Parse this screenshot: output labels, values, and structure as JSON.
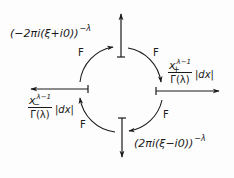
{
  "diagram": {
    "nodes": {
      "top": {
        "base": "(−2πi(ξ+i0))",
        "exponent": "−λ"
      },
      "right": {
        "numerator_base": "x",
        "numerator_sub": "+",
        "numerator_exp": "λ−1",
        "denominator": "Γ(λ)",
        "measure": "|dx|"
      },
      "bottom": {
        "base": "(2πi(ξ−i0))",
        "exponent": "−λ"
      },
      "left": {
        "numerator_base": "x",
        "numerator_sub": "−",
        "numerator_exp": "λ−1",
        "denominator": "Γ(λ)",
        "measure": "|dx|"
      }
    },
    "edges": [
      {
        "from": "left",
        "to": "top",
        "label": "F"
      },
      {
        "from": "top",
        "to": "right",
        "label": "F"
      },
      {
        "from": "right",
        "to": "bottom",
        "label": "F"
      },
      {
        "from": "bottom",
        "to": "left",
        "label": "F"
      }
    ],
    "axes": [
      "up",
      "right",
      "down",
      "left"
    ],
    "direction": "clockwise"
  }
}
